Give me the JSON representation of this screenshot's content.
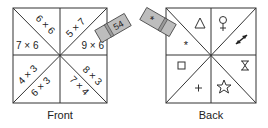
{
  "front": {
    "caption": "Front",
    "cells": {
      "top_left_upper": "6 × 6",
      "top_left_lower": "7 × 6",
      "top_right_upper": "5 × 7",
      "top_right_lower": "9 × 6",
      "bottom_left_upper": "4 × 3",
      "bottom_left_lower": "6 × 3",
      "bottom_right_upper": "8 × 3",
      "bottom_right_lower": "7 × 4"
    },
    "tab_label": "54"
  },
  "back": {
    "caption": "Back",
    "symbols": {
      "top_left_upper": "triangle",
      "top_left_lower": "asterisk",
      "top_right_upper": "female-sign",
      "top_right_lower": "double-arrow",
      "bottom_left_upper": "square",
      "bottom_left_lower": "plus",
      "bottom_right_upper": "hourglass",
      "bottom_right_lower": "star"
    },
    "tab_label": "*",
    "glyphs": {
      "triangle": "△",
      "asterisk": "*",
      "female": "♀",
      "square": "□",
      "plus": "+",
      "hourglass": "⧗",
      "star": "☆"
    }
  },
  "colors": {
    "line": "#333333",
    "tab_fill": "#bdbdbd"
  }
}
